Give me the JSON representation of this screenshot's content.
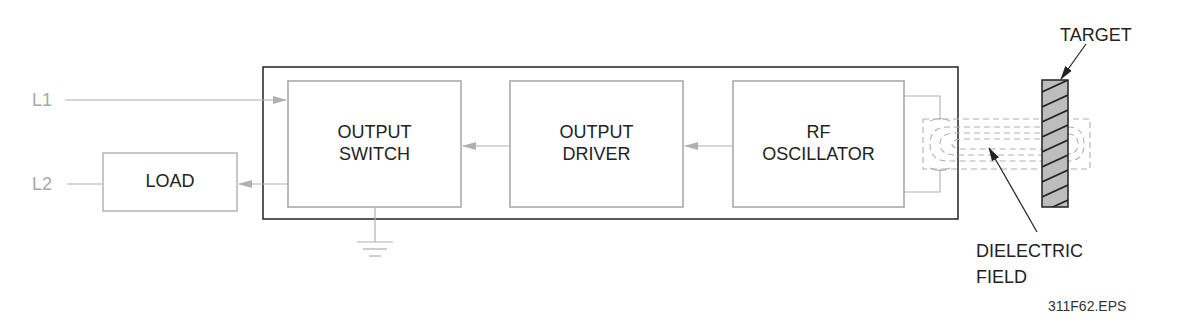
{
  "diagram": {
    "inputs": {
      "l1": "L1",
      "l2": "L2"
    },
    "blocks": {
      "load": {
        "line1": "LOAD"
      },
      "output_switch": {
        "line1": "OUTPUT",
        "line2": "SWITCH"
      },
      "output_driver": {
        "line1": "OUTPUT",
        "line2": "DRIVER"
      },
      "rf_oscillator": {
        "line1": "RF",
        "line2": "OSCILLATOR"
      }
    },
    "callouts": {
      "target": "TARGET",
      "dielectric_line1": "DIELECTRIC",
      "dielectric_line2": "FIELD"
    },
    "figure_id": "311F62.EPS",
    "colors": {
      "block_stroke": "#b4b4b4",
      "housing_stroke": "#222222",
      "target_fill": "#bdbdbd",
      "field_dash": "#b0b0b0"
    }
  }
}
